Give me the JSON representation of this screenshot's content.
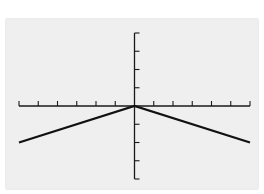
{
  "chart_data": {
    "type": "line",
    "title": "",
    "xlabel": "",
    "ylabel": "",
    "xlim": [
      -6,
      6
    ],
    "ylim": [
      -4,
      4
    ],
    "x_tick_step": 1,
    "y_tick_step": 1,
    "grid": false,
    "legend": null,
    "series": [
      {
        "name": "y = -|x|/3",
        "x": [
          -6,
          0,
          6
        ],
        "y": [
          -2,
          0,
          -2
        ]
      }
    ]
  },
  "colors": {
    "screen_background": "#efefef",
    "axis": "#1a1a1a",
    "line": "#111111"
  }
}
